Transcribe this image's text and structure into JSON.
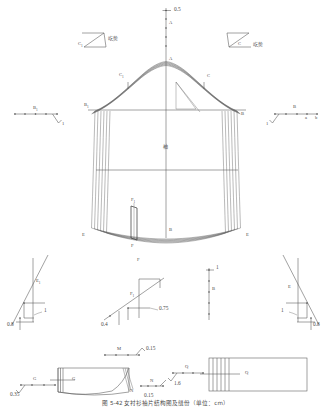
{
  "figure": {
    "domain_type": "technical-pattern-drawing",
    "caption": "图 5-42  女衬衫袖片结构图及缝份（单位：cm）",
    "ink_color": "#4a4a4a",
    "line_color": "#555555",
    "background": "#ffffff"
  },
  "top_scale": {
    "name": "vertical-tick-scale",
    "value_label": "0.5",
    "point_label": "A",
    "tick_count": 5
  },
  "ease_notes": {
    "left": {
      "point": "C",
      "subscript": "1",
      "text": "吃势"
    },
    "right": {
      "point": "C",
      "subscript": "",
      "text": "吃势"
    }
  },
  "side_scales": {
    "left": {
      "name": "left-dot-scale",
      "main_label": "B",
      "main_sub": "1",
      "hook_label": "1",
      "dot_count": 5
    },
    "right": {
      "name": "right-dot-scale",
      "main_label": "B",
      "hook_label": "1",
      "minor_labels": [
        "a",
        "b"
      ],
      "dot_count": 5
    }
  },
  "sleeve": {
    "apex_label": "A",
    "cap_left_label": "C",
    "cap_left_sub": "1",
    "cap_right_label": "C",
    "biceps_left_label": "B",
    "biceps_left_sub": "1",
    "biceps_right_label": "B",
    "center_label": "袖",
    "hem_left_label": "E",
    "hem_right_label": "E",
    "hem_center_label": "B",
    "dart_label": "F",
    "dart_sub": "1",
    "hem_bottom_label": "F",
    "band_count": 6
  },
  "details": {
    "left_detail": {
      "name": "left-underarm-detail",
      "point_label": "E",
      "point_sub": "1",
      "dim_a": "0.8",
      "dim_b": "1"
    },
    "center_detail": {
      "name": "center-dart-detail",
      "top_label": "F",
      "point_label": "F",
      "point_sub": "1",
      "dim_a": "0.4",
      "dim_b": "0.75"
    },
    "center_scale": {
      "name": "center-vertical-scale",
      "value_label": "1",
      "point_label": "B",
      "tick_count": 5
    },
    "right_detail": {
      "name": "right-underarm-detail",
      "point_label": "E",
      "dim_a": "1",
      "dim_b": "0.8"
    }
  },
  "bottom": {
    "cuff": {
      "name": "cuff-piece",
      "inner_label": "G",
      "edge_label": "N"
    },
    "left_scale": {
      "name": "g-dot-scale",
      "main_label": "G",
      "dim": "0.35",
      "dot_count": 4
    },
    "m_scale": {
      "name": "m-dot-scale",
      "main_label": "M",
      "dim": "0.15",
      "dot_count": 4
    },
    "n_scale": {
      "name": "n-dot-scale",
      "main_label": "N",
      "dim": "0.15",
      "dot_count": 4
    },
    "q_scale": {
      "name": "q-dot-scale",
      "main_label": "Q",
      "dim": "1.6",
      "dot_count": 4
    },
    "placket": {
      "name": "placket-piece",
      "label": "Q"
    }
  }
}
